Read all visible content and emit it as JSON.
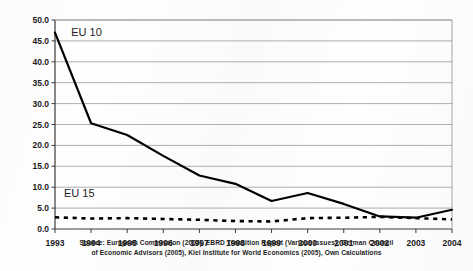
{
  "chart_data": {
    "type": "line",
    "title": "",
    "subtitle": "",
    "xlabel": "",
    "ylabel": "",
    "categories": [
      "1993",
      "1994",
      "1995",
      "1996",
      "1997",
      "1998",
      "1999",
      "2000",
      "2001",
      "2002",
      "2003",
      "2004"
    ],
    "x": [
      1993,
      1994,
      1995,
      1996,
      1997,
      1998,
      1999,
      2000,
      2001,
      2002,
      2003,
      2004
    ],
    "ylim": [
      0.0,
      50.0
    ],
    "ytick_step": 5.0,
    "ytick_labels": [
      "0.0",
      "5.0",
      "10.0",
      "15.0",
      "20.0",
      "25.0",
      "30.0",
      "35.0",
      "40.0",
      "45.0",
      "50.0"
    ],
    "ytick_values": [
      0.0,
      5.0,
      10.0,
      15.0,
      20.0,
      25.0,
      30.0,
      35.0,
      40.0,
      45.0,
      50.0
    ],
    "grid": "horizontal",
    "legend": "inline-labels",
    "series": [
      {
        "name": "EU 10",
        "style": "solid",
        "color": "#000000",
        "values": [
          47.0,
          25.3,
          22.5,
          17.5,
          12.8,
          10.8,
          6.7,
          8.6,
          6.0,
          3.0,
          2.7,
          4.6
        ]
      },
      {
        "name": "EU 15",
        "style": "dashed",
        "color": "#000000",
        "values": [
          2.8,
          2.5,
          2.6,
          2.4,
          2.2,
          1.9,
          1.8,
          2.6,
          2.7,
          2.9,
          2.6,
          2.3
        ]
      }
    ],
    "annotations": [
      {
        "text": "EU 10",
        "x": 1993.45,
        "y": 46.2
      },
      {
        "text": "EU 15",
        "x": 1993.25,
        "y": 7.6
      }
    ]
  },
  "source": {
    "line1": "Source: European Commission (2005), EBRD Transition Report (Various Issues), German Council",
    "line2": "of Economic Advisors (2005), Kiel Institute for World Economics (2005), Own Calculations"
  }
}
